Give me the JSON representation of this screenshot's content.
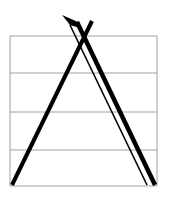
{
  "diagram": {
    "colors": {
      "background": "#ffffff",
      "guide_line": "#8a8a8a",
      "stroke": "#000000"
    },
    "box": {
      "x1": 10,
      "x2": 157,
      "y_top": 36,
      "y_bottom": 186
    },
    "guide_lines_y": [
      36,
      73,
      112,
      150,
      186
    ],
    "strokes": [
      {
        "name": "left-diagonal",
        "x1": 12,
        "y1": 185,
        "x2": 92,
        "y2": 21,
        "width": 4
      },
      {
        "name": "right-outer-diagonal",
        "x1": 77,
        "y1": 22,
        "x2": 155,
        "y2": 185,
        "width": 4.5
      },
      {
        "name": "right-inner-diagonal",
        "x1": 70,
        "y1": 25,
        "x2": 147,
        "y2": 185,
        "width": 1.6
      }
    ],
    "pen_nib": {
      "points": "62,15 78,22 80,28 70,25"
    }
  }
}
